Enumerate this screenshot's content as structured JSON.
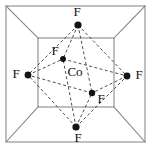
{
  "figure": {
    "name": "octahedral-coordination-diagram",
    "width": 152,
    "height": 149,
    "background_color": "#ffffff"
  },
  "cube": {
    "edge_color": "#8a8a8a",
    "edge_width": 1.1,
    "front_face": {
      "left": 6,
      "top": 6,
      "right": 145,
      "bottom": 142
    },
    "back_face": {
      "left": 38,
      "top": 38,
      "right": 114,
      "bottom": 107
    },
    "corner_connectors": [
      {
        "name": "top-left-connector",
        "x1": 6,
        "y1": 6,
        "x2": 38,
        "y2": 38
      },
      {
        "name": "top-right-connector",
        "x1": 145,
        "y1": 6,
        "x2": 114,
        "y2": 38
      },
      {
        "name": "bottom-left-connector",
        "x1": 6,
        "y1": 142,
        "x2": 38,
        "y2": 107
      },
      {
        "name": "bottom-right-connector",
        "x1": 145,
        "y1": 142,
        "x2": 114,
        "y2": 107
      }
    ]
  },
  "octahedron": {
    "bond_color": "#3a3a3a",
    "bond_width": 0.9,
    "bond_dash": "3,2.4",
    "vertices": [
      {
        "id": "f-top",
        "label": "F",
        "x": 78,
        "y": 25,
        "label_x": 77,
        "label_y": 13,
        "dot_r": 3.6
      },
      {
        "id": "f-upper-inner",
        "label": "F",
        "x": 63,
        "y": 59,
        "label_x": 55,
        "label_y": 52,
        "dot_r": 3.0
      },
      {
        "id": "f-left",
        "label": "F",
        "x": 28,
        "y": 75,
        "label_x": 16,
        "label_y": 75,
        "dot_r": 3.4
      },
      {
        "id": "f-right",
        "label": "F",
        "x": 127,
        "y": 76,
        "label_x": 139,
        "label_y": 76,
        "dot_r": 3.4
      },
      {
        "id": "f-lower-inner",
        "label": "F",
        "x": 92,
        "y": 93,
        "label_x": 101,
        "label_y": 100,
        "dot_r": 3.2
      },
      {
        "id": "f-bottom",
        "label": "F",
        "x": 76,
        "y": 127,
        "label_x": 78,
        "label_y": 139,
        "dot_r": 3.6
      }
    ],
    "edges": [
      {
        "from": "f-top",
        "to": "f-upper-inner"
      },
      {
        "from": "f-top",
        "to": "f-left"
      },
      {
        "from": "f-top",
        "to": "f-right"
      },
      {
        "from": "f-top",
        "to": "f-lower-inner"
      },
      {
        "from": "f-bottom",
        "to": "f-upper-inner"
      },
      {
        "from": "f-bottom",
        "to": "f-left"
      },
      {
        "from": "f-bottom",
        "to": "f-right"
      },
      {
        "from": "f-bottom",
        "to": "f-lower-inner"
      },
      {
        "from": "f-left",
        "to": "f-upper-inner"
      },
      {
        "from": "f-upper-inner",
        "to": "f-right"
      },
      {
        "from": "f-right",
        "to": "f-lower-inner"
      },
      {
        "from": "f-lower-inner",
        "to": "f-left"
      }
    ],
    "center": {
      "id": "co-center",
      "label": "Co",
      "label_x": 75,
      "label_y": 73
    }
  }
}
